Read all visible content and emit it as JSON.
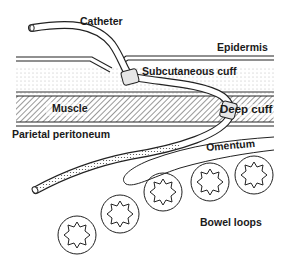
{
  "labels": {
    "catheter": "Catheter",
    "epidermis": "Epidermis",
    "subcutaneous_cuff": "Subcutaneous cuff",
    "muscle": "Muscle",
    "deep_cuff": "Deep cuff",
    "parietal_peritoneum": "Parietal peritoneum",
    "omentum": "Omentum",
    "bowel_loops": "Bowel loops"
  },
  "layers": [
    {
      "name": "Epidermis",
      "pattern": "double-line"
    },
    {
      "name": "Subcutaneous tissue",
      "pattern": "dotted"
    },
    {
      "name": "Muscle",
      "pattern": "hatched"
    },
    {
      "name": "Parietal peritoneum",
      "pattern": "line"
    }
  ],
  "bowel_loop_count": 5,
  "colors": {
    "ink": "#1a1a1a",
    "cuff_fill": "#e6e6e6",
    "background": "#ffffff"
  }
}
